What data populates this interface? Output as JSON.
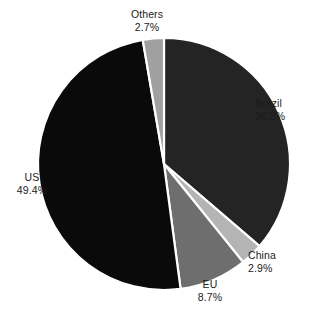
{
  "chart_data": {
    "type": "pie",
    "title": "",
    "subtitle": "",
    "xlabel": "",
    "ylabel": "",
    "legend": "none",
    "grid": false,
    "labels_position": "outside",
    "units": "percent",
    "total": "100.0",
    "categories": [
      "Brazil",
      "China",
      "EU",
      "US",
      "Others"
    ],
    "values": [
      36.3,
      2.9,
      8.7,
      49.4,
      2.7
    ],
    "slices": [
      {
        "id": "brazil",
        "name": "Brazil",
        "value": 36.3,
        "value_label": "36.3%",
        "color": "#242424",
        "start_angle": 0.0,
        "end_angle": 130.68
      },
      {
        "id": "china",
        "name": "China",
        "value": 2.9,
        "value_label": "2.9%",
        "color": "#b4b4b4",
        "start_angle": 130.68,
        "end_angle": 141.12
      },
      {
        "id": "eu",
        "name": "EU",
        "value": 8.7,
        "value_label": "8.7%",
        "color": "#6e6e6e",
        "start_angle": 141.12,
        "end_angle": 172.44
      },
      {
        "id": "us",
        "name": "US",
        "value": 49.4,
        "value_label": "49.4%",
        "color": "#0a0a0a",
        "start_angle": 172.44,
        "end_angle": 350.28
      },
      {
        "id": "others",
        "name": "Others",
        "value": 2.7,
        "value_label": "2.7%",
        "color": "#a0a0a0",
        "start_angle": 350.28,
        "end_angle": 360.0
      }
    ],
    "geometry": {
      "center_x": 164,
      "center_y": 164,
      "radius": 126,
      "start_at_twelve_oclock": true,
      "direction": "clockwise",
      "separator_color": "#ffffff"
    }
  },
  "labels": {
    "others": {
      "name": "Others",
      "value": "2.7%"
    },
    "brazil": {
      "name": "Brazil",
      "value": "36.3%"
    },
    "china": {
      "name": "China",
      "value": "2.9%"
    },
    "eu": {
      "name": "EU",
      "value": "8.7%"
    },
    "us": {
      "name": "US",
      "value": "49.4%"
    }
  }
}
